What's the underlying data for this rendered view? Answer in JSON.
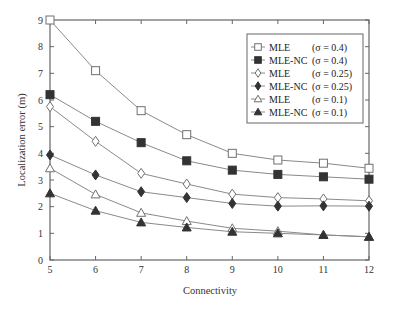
{
  "chart_data": {
    "type": "line",
    "title": "",
    "xlabel": "Connectivity",
    "ylabel": "Localization error (m)",
    "x": [
      5,
      6,
      7,
      8,
      9,
      10,
      11,
      12
    ],
    "xlim": [
      5,
      12
    ],
    "ylim": [
      0,
      9
    ],
    "xticks": [
      "5",
      "6",
      "7",
      "8",
      "9",
      "10",
      "11",
      "12"
    ],
    "yticks": [
      "0",
      "1",
      "2",
      "3",
      "4",
      "5",
      "6",
      "7",
      "8",
      "9"
    ],
    "grid": false,
    "legend_position": "upper right",
    "series": [
      {
        "name": "MLE",
        "sigma": "(σ = 0.4)",
        "marker": "square-open",
        "values": [
          9.0,
          7.1,
          5.6,
          4.7,
          4.0,
          3.75,
          3.63,
          3.44
        ]
      },
      {
        "name": "MLE-NC",
        "sigma": "(σ = 0.4)",
        "marker": "square-filled",
        "values": [
          6.2,
          5.2,
          4.4,
          3.72,
          3.37,
          3.21,
          3.12,
          3.03
        ]
      },
      {
        "name": "MLE",
        "sigma": "(σ = 0.25)",
        "marker": "diamond-open",
        "values": [
          5.75,
          4.45,
          3.25,
          2.85,
          2.47,
          2.34,
          2.29,
          2.22
        ]
      },
      {
        "name": "MLE-NC",
        "sigma": "(σ = 0.25)",
        "marker": "diamond-filled",
        "values": [
          3.94,
          3.19,
          2.56,
          2.34,
          2.12,
          2.02,
          2.03,
          2.02
        ]
      },
      {
        "name": "MLE",
        "sigma": "(σ = 0.1)",
        "marker": "triangle-open",
        "values": [
          3.44,
          2.46,
          1.77,
          1.46,
          1.19,
          1.08,
          0.94,
          0.87
        ]
      },
      {
        "name": "MLE-NC",
        "sigma": "(σ = 0.1)",
        "marker": "triangle-filled",
        "values": [
          2.5,
          1.85,
          1.41,
          1.22,
          1.06,
          1.0,
          0.94,
          0.87
        ]
      }
    ]
  },
  "colors": {
    "line": "#8a8a8a",
    "filled_marker": "#333333",
    "open_marker_stroke": "#707070",
    "axis": "#666666"
  }
}
